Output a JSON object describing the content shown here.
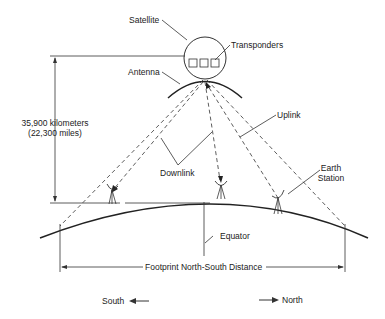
{
  "labels": {
    "satellite": "Satellite",
    "transponders": "Transponders",
    "antenna": "Antenna",
    "distance_km": "35,900 kilometers",
    "distance_mi": "(22,300 miles)",
    "uplink": "Uplink",
    "downlink": "Downlink",
    "earth_station_line1": "Earth",
    "earth_station_line2": "Station",
    "equator": "Equator",
    "footprint": "Footprint North-South Distance",
    "south": "South",
    "north": "North"
  },
  "colors": {
    "line": "#333333",
    "background": "#ffffff"
  }
}
